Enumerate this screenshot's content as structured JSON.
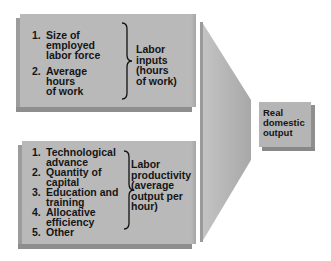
{
  "diagram": {
    "labor_inputs_box": {
      "items": [
        {
          "num": "1.",
          "text": "Size of\nemployed\nlabor force"
        },
        {
          "num": "2.",
          "text": "Average\nhours\nof work"
        }
      ],
      "label": "Labor\ninputs\n(hours\nof work)"
    },
    "labor_productivity_box": {
      "items": [
        {
          "num": "1.",
          "text": "Technological\nadvance"
        },
        {
          "num": "2.",
          "text": "Quantity of\ncapital"
        },
        {
          "num": "3.",
          "text": "Education and\ntraining"
        },
        {
          "num": "4.",
          "text": "Allocative\nefficiency"
        },
        {
          "num": "5.",
          "text": "Other"
        }
      ],
      "label": "Labor\nproductivity\n(average\noutput per\nhour)"
    },
    "output_box": {
      "label": "Real\ndomestic\noutput"
    },
    "colors": {
      "box_face": "#b9b9b9",
      "box_shadow": "#8e8e8e",
      "funnel": "#b0b0b0",
      "text": "#151515"
    }
  }
}
